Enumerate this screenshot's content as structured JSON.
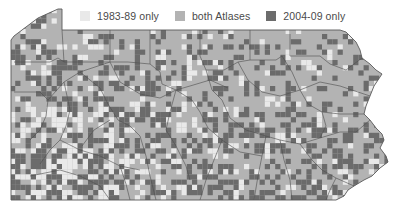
{
  "map": {
    "region": "Pennsylvania",
    "background": "#ffffff",
    "colors": {
      "only_1983_89": "#e9e9e9",
      "both_atlases": "#b3b3b3",
      "only_2004_09": "#6c6c6c",
      "boundary": "#4d4d4d"
    }
  },
  "legend": {
    "items": [
      {
        "label": "1983-89 only",
        "color": "#e9e9e9"
      },
      {
        "label": "both Atlases",
        "color": "#b3b3b3"
      },
      {
        "label": "2004-09 only",
        "color": "#6c6c6c"
      }
    ]
  }
}
